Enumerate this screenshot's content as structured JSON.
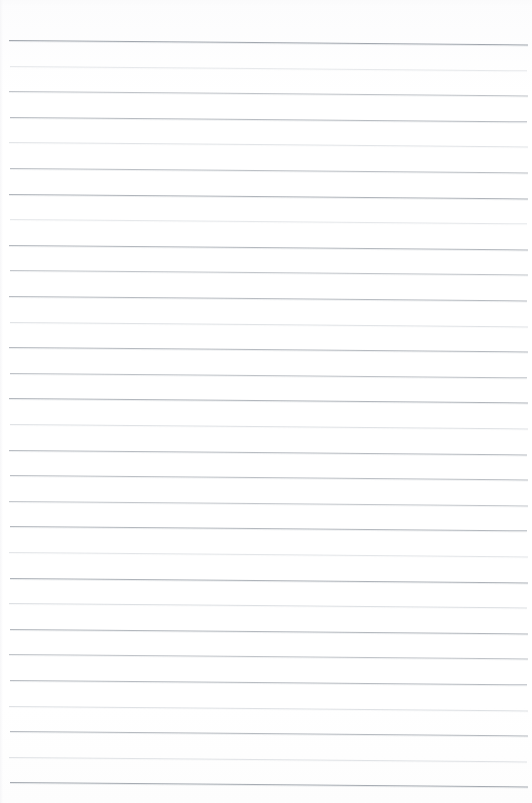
{
  "document": {
    "kind": "scanned-ruled-paper",
    "description": "Blank scanned sheet of ruled notebook paper",
    "text_content": "",
    "page_width": 532,
    "page_height": 803,
    "background_color": "#ffffff"
  },
  "ruling": {
    "line_color": "#9aa0a8",
    "line_color_faint": "#c3c8ce",
    "line_count": 30,
    "line_spacing": 25.6,
    "first_line_y": 40,
    "last_line_y": 782,
    "line_start_x": 9,
    "line_end_x": 528,
    "line_thickness": 1,
    "skew_drop_px": 4.5,
    "lines": [
      {
        "y": 40,
        "x1": 9,
        "x2": 528,
        "opacity": 0.92,
        "faint": false
      },
      {
        "y": 65.6,
        "x1": 10,
        "x2": 527,
        "opacity": 0.4,
        "faint": true
      },
      {
        "y": 91.2,
        "x1": 9,
        "x2": 528,
        "opacity": 0.62,
        "faint": false
      },
      {
        "y": 116.8,
        "x1": 10,
        "x2": 527,
        "opacity": 0.7,
        "faint": false
      },
      {
        "y": 142.4,
        "x1": 9,
        "x2": 528,
        "opacity": 0.48,
        "faint": true
      },
      {
        "y": 168.0,
        "x1": 10,
        "x2": 528,
        "opacity": 0.66,
        "faint": false
      },
      {
        "y": 193.6,
        "x1": 9,
        "x2": 528,
        "opacity": 0.78,
        "faint": false
      },
      {
        "y": 219.2,
        "x1": 10,
        "x2": 527,
        "opacity": 0.42,
        "faint": true
      },
      {
        "y": 244.8,
        "x1": 9,
        "x2": 528,
        "opacity": 0.74,
        "faint": false
      },
      {
        "y": 270.4,
        "x1": 10,
        "x2": 528,
        "opacity": 0.6,
        "faint": false
      },
      {
        "y": 296.0,
        "x1": 9,
        "x2": 527,
        "opacity": 0.7,
        "faint": false
      },
      {
        "y": 321.6,
        "x1": 10,
        "x2": 528,
        "opacity": 0.5,
        "faint": true
      },
      {
        "y": 347.2,
        "x1": 9,
        "x2": 528,
        "opacity": 0.72,
        "faint": false
      },
      {
        "y": 372.8,
        "x1": 10,
        "x2": 527,
        "opacity": 0.64,
        "faint": false
      },
      {
        "y": 398.4,
        "x1": 9,
        "x2": 528,
        "opacity": 0.76,
        "faint": false
      },
      {
        "y": 424.0,
        "x1": 10,
        "x2": 528,
        "opacity": 0.52,
        "faint": true
      },
      {
        "y": 449.6,
        "x1": 9,
        "x2": 527,
        "opacity": 0.7,
        "faint": false
      },
      {
        "y": 475.2,
        "x1": 10,
        "x2": 528,
        "opacity": 0.66,
        "faint": false
      },
      {
        "y": 500.8,
        "x1": 9,
        "x2": 528,
        "opacity": 0.58,
        "faint": false
      },
      {
        "y": 526.4,
        "x1": 10,
        "x2": 527,
        "opacity": 0.74,
        "faint": false
      },
      {
        "y": 552.0,
        "x1": 9,
        "x2": 528,
        "opacity": 0.46,
        "faint": true
      },
      {
        "y": 577.6,
        "x1": 10,
        "x2": 528,
        "opacity": 0.8,
        "faint": false
      },
      {
        "y": 603.2,
        "x1": 9,
        "x2": 527,
        "opacity": 0.56,
        "faint": true
      },
      {
        "y": 628.8,
        "x1": 10,
        "x2": 528,
        "opacity": 0.74,
        "faint": false
      },
      {
        "y": 654.4,
        "x1": 9,
        "x2": 528,
        "opacity": 0.62,
        "faint": false
      },
      {
        "y": 680.0,
        "x1": 10,
        "x2": 527,
        "opacity": 0.7,
        "faint": false
      },
      {
        "y": 705.6,
        "x1": 9,
        "x2": 528,
        "opacity": 0.54,
        "faint": true
      },
      {
        "y": 731.2,
        "x1": 10,
        "x2": 528,
        "opacity": 0.72,
        "faint": false
      },
      {
        "y": 756.8,
        "x1": 9,
        "x2": 527,
        "opacity": 0.5,
        "faint": true
      },
      {
        "y": 782.0,
        "x1": 10,
        "x2": 528,
        "opacity": 0.88,
        "faint": false
      }
    ]
  }
}
